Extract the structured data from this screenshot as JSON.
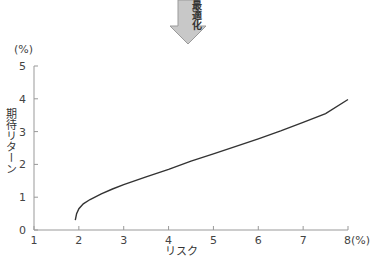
{
  "header": {
    "arrow_label": "最適化",
    "arrow_color": "#c8c8c8"
  },
  "chart_data": {
    "type": "line",
    "title": "",
    "xlabel": "リスク",
    "ylabel": "期待リターン",
    "x_unit": "(%)",
    "y_unit": "(%)",
    "xlim": [
      1,
      8
    ],
    "ylim": [
      0,
      5
    ],
    "x_ticks": [
      "1",
      "2",
      "3",
      "4",
      "5",
      "6",
      "7",
      "8(%)"
    ],
    "y_ticks": [
      "0",
      "1",
      "2",
      "3",
      "4",
      "5"
    ],
    "grid": false,
    "legend": null,
    "series": [
      {
        "name": "efficient frontier",
        "color": "#333333",
        "x": [
          1.92,
          1.95,
          2.0,
          2.1,
          2.25,
          2.5,
          2.75,
          3.0,
          3.5,
          4.0,
          4.5,
          5.0,
          5.5,
          6.0,
          6.5,
          7.0,
          7.5,
          8.0
        ],
        "y": [
          0.3,
          0.5,
          0.65,
          0.8,
          0.93,
          1.1,
          1.25,
          1.38,
          1.62,
          1.85,
          2.1,
          2.32,
          2.55,
          2.78,
          3.02,
          3.28,
          3.55,
          3.98
        ]
      }
    ]
  }
}
